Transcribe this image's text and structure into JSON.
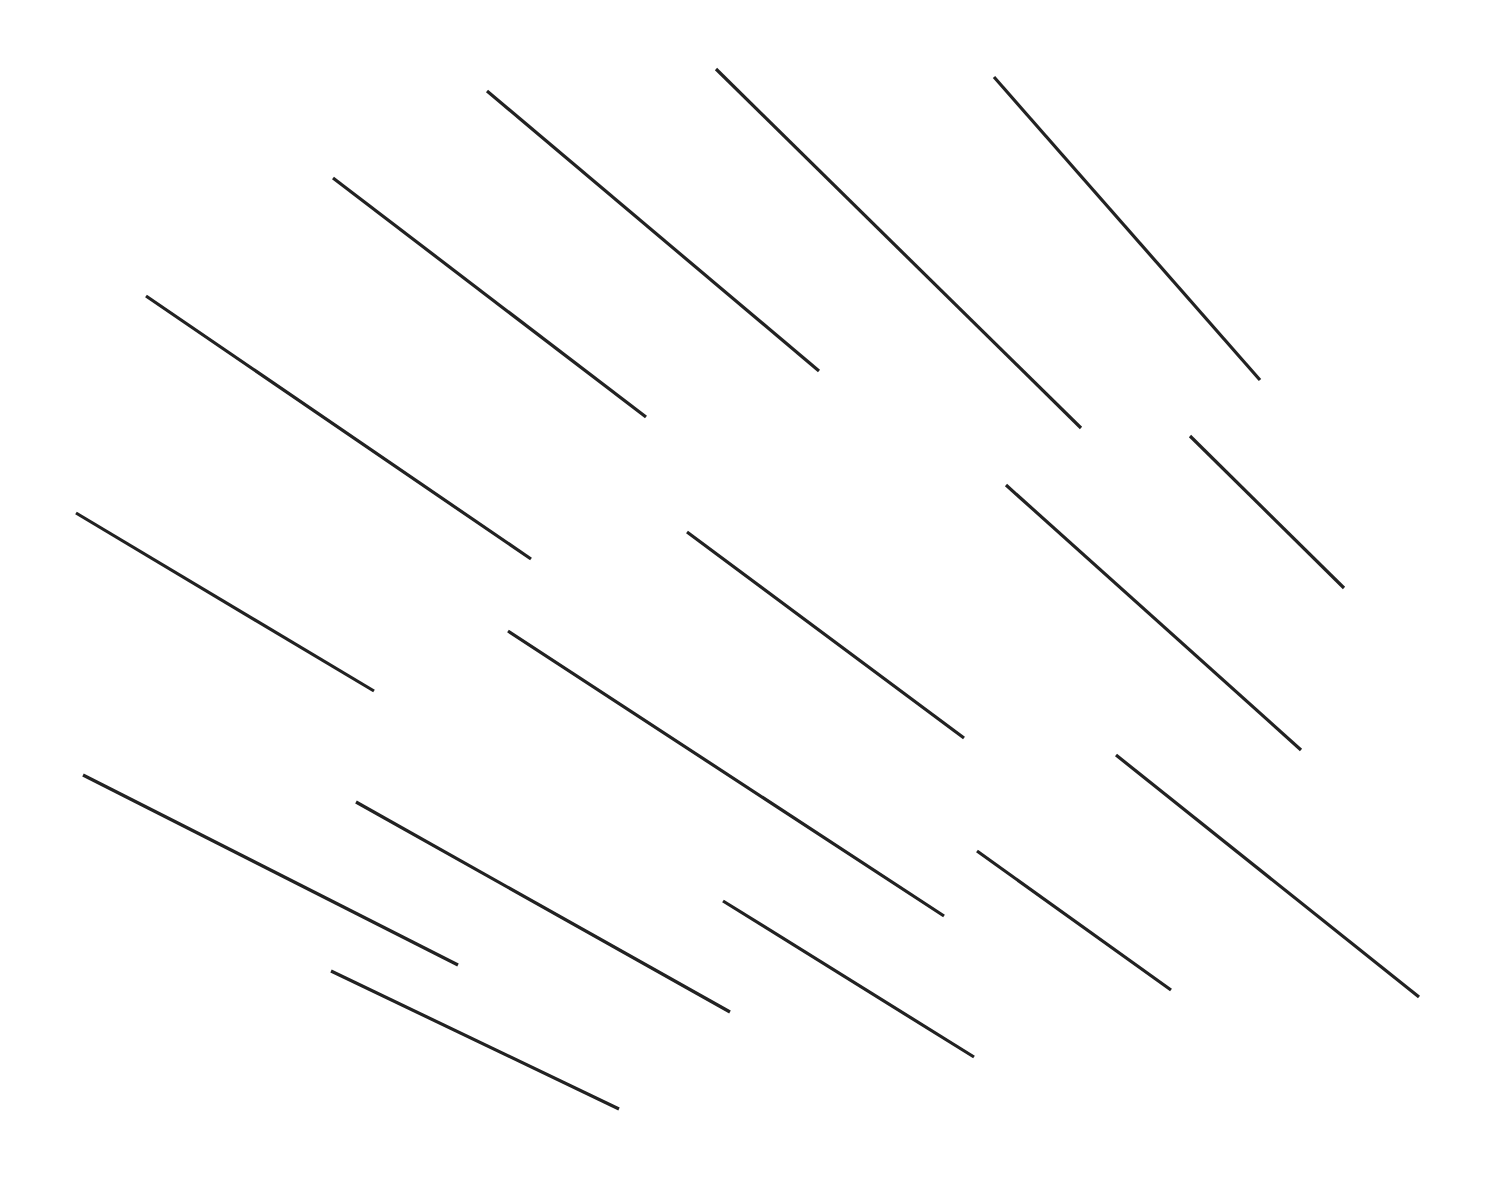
{
  "canvas": {
    "width": 1489,
    "height": 1188,
    "background": "#ffffff",
    "stroke_color": "#222222",
    "stroke_width": 3.2
  },
  "segments": [
    {
      "x1": 487,
      "y1": 91,
      "x2": 819,
      "y2": 371
    },
    {
      "x1": 716,
      "y1": 69,
      "x2": 1081,
      "y2": 428
    },
    {
      "x1": 994,
      "y1": 77,
      "x2": 1260,
      "y2": 380
    },
    {
      "x1": 333,
      "y1": 178,
      "x2": 646,
      "y2": 417
    },
    {
      "x1": 146,
      "y1": 296,
      "x2": 531,
      "y2": 559
    },
    {
      "x1": 1190,
      "y1": 436,
      "x2": 1344,
      "y2": 588
    },
    {
      "x1": 1006,
      "y1": 485,
      "x2": 1301,
      "y2": 750
    },
    {
      "x1": 76,
      "y1": 513,
      "x2": 374,
      "y2": 691
    },
    {
      "x1": 687,
      "y1": 532,
      "x2": 964,
      "y2": 738
    },
    {
      "x1": 508,
      "y1": 631,
      "x2": 944,
      "y2": 916
    },
    {
      "x1": 1116,
      "y1": 755,
      "x2": 1419,
      "y2": 997
    },
    {
      "x1": 83,
      "y1": 775,
      "x2": 458,
      "y2": 965
    },
    {
      "x1": 356,
      "y1": 802,
      "x2": 730,
      "y2": 1012
    },
    {
      "x1": 977,
      "y1": 851,
      "x2": 1171,
      "y2": 990
    },
    {
      "x1": 723,
      "y1": 901,
      "x2": 974,
      "y2": 1057
    },
    {
      "x1": 331,
      "y1": 971,
      "x2": 619,
      "y2": 1109
    }
  ]
}
